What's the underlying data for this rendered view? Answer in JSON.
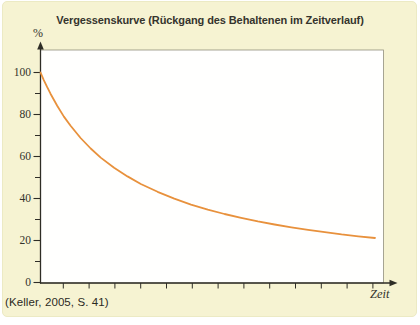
{
  "figure": {
    "title": "Vergessenskurve (Rückgang des Behaltenen im Zeitverlauf)",
    "y_axis_unit": "%",
    "x_axis_label": "Zeit",
    "citation": "(Keller, 2005, S. 41)",
    "background_color": "#f6f3d2",
    "plot_background": "#fffffe",
    "plot_border_color": "#918f7d",
    "axis_color": "#2e2d26",
    "text_color": "#33322b"
  },
  "chart_data": {
    "type": "line",
    "title": "Vergessenskurve (Rückgang des Behaltenen im Zeitverlauf)",
    "xlabel": "Zeit",
    "ylabel": "%",
    "ylim": [
      0,
      100
    ],
    "grid": false,
    "legend": "none",
    "y_major_ticks": [
      100,
      80,
      60,
      40,
      20,
      0
    ],
    "y_minor_ticks": [
      90,
      70,
      50,
      30,
      10
    ],
    "x_tick_count": 13,
    "x_tick_labels": [],
    "series": [
      {
        "name": "Vergessenskurve",
        "color": "#e8913c",
        "points_t_pct": [
          [
            0,
            100
          ],
          [
            0.01,
            96.4
          ],
          [
            0.02,
            93.0
          ],
          [
            0.03,
            89.9
          ],
          [
            0.05,
            84.2
          ],
          [
            0.07,
            79.0
          ],
          [
            0.09,
            74.6
          ],
          [
            0.12,
            68.8
          ],
          [
            0.15,
            63.8
          ],
          [
            0.18,
            59.5
          ],
          [
            0.22,
            54.6
          ],
          [
            0.26,
            50.5
          ],
          [
            0.3,
            46.9
          ],
          [
            0.35,
            43.2
          ],
          [
            0.4,
            39.9
          ],
          [
            0.45,
            37.1
          ],
          [
            0.5,
            34.7
          ],
          [
            0.55,
            32.6
          ],
          [
            0.6,
            30.8
          ],
          [
            0.65,
            29.1
          ],
          [
            0.7,
            27.6
          ],
          [
            0.75,
            26.3
          ],
          [
            0.8,
            25.1
          ],
          [
            0.85,
            24.0
          ],
          [
            0.9,
            22.9
          ],
          [
            0.95,
            22.0
          ],
          [
            1.0,
            21.2
          ]
        ]
      }
    ]
  }
}
